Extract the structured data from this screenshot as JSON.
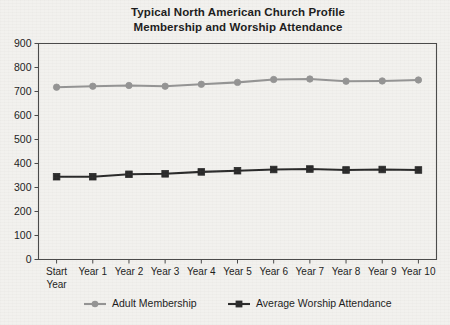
{
  "chart_data": {
    "type": "line",
    "title": "Typical North American Church Profile Membership and Worship Attendance",
    "title_lines": [
      "Typical North American Church Profile",
      "Membership and Worship Attendance"
    ],
    "xlabel": "",
    "ylabel": "",
    "categories": [
      "Start Year",
      "Year 1",
      "Year 2",
      "Year 3",
      "Year 4",
      "Year 5",
      "Year 6",
      "Year 7",
      "Year 8",
      "Year 9",
      "Year 10"
    ],
    "category_lines": [
      [
        "Start",
        "Year"
      ],
      [
        "Year 1"
      ],
      [
        "Year 2"
      ],
      [
        "Year 3"
      ],
      [
        "Year 4"
      ],
      [
        "Year 5"
      ],
      [
        "Year 6"
      ],
      [
        "Year 7"
      ],
      [
        "Year 8"
      ],
      [
        "Year 9"
      ],
      [
        "Year 10"
      ]
    ],
    "ylim": [
      0,
      900
    ],
    "ytick_labels": [
      "0",
      "100",
      "200",
      "300",
      "400",
      "500",
      "600",
      "700",
      "800",
      "900"
    ],
    "yticks": [
      0,
      100,
      200,
      300,
      400,
      500,
      600,
      700,
      800,
      900
    ],
    "grid": false,
    "legend_position": "bottom",
    "series": [
      {
        "name": "Adult Membership",
        "color": "#949494",
        "marker": "circle",
        "values": [
          718,
          722,
          725,
          722,
          730,
          738,
          750,
          752,
          743,
          744,
          748
        ]
      },
      {
        "name": "Average Worship Attendance",
        "color": "#2a2a2a",
        "marker": "square",
        "values": [
          345,
          345,
          355,
          357,
          365,
          370,
          375,
          377,
          373,
          375,
          373
        ]
      }
    ]
  },
  "colors": {
    "page_background": "#f2f1ee",
    "axis": "#4a4a4a",
    "text": "#1c1c1c",
    "series_membership": "#949494",
    "series_attendance": "#2a2a2a"
  }
}
